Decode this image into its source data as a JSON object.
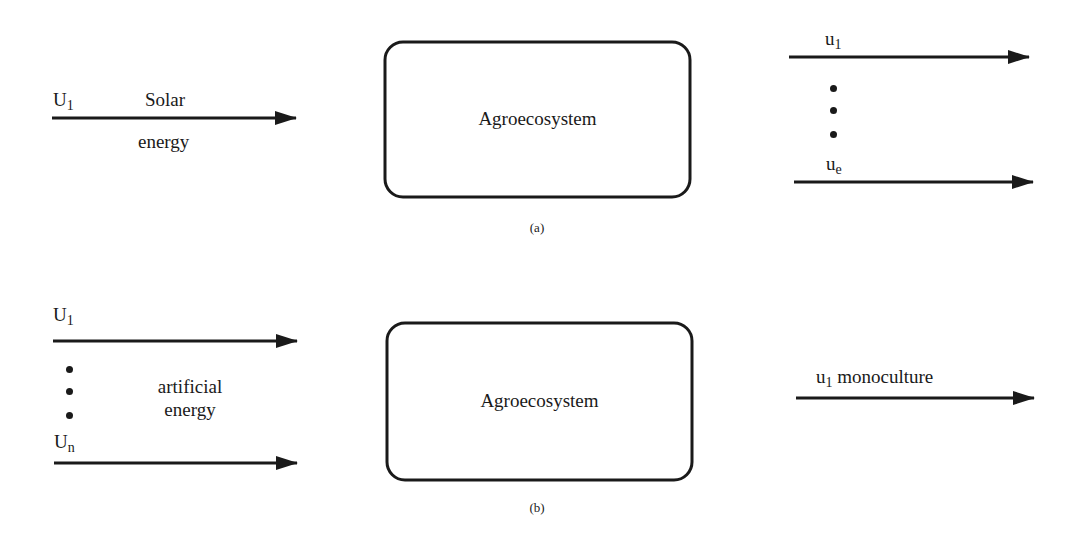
{
  "panel_a": {
    "input": {
      "symbol": "U",
      "subscript": "1",
      "label_top": "Solar",
      "label_bottom": "energy"
    },
    "system_label": "Agroecosystem",
    "outputs": [
      {
        "symbol": "u",
        "subscript": "1"
      },
      {
        "symbol": "u",
        "subscript": "e"
      }
    ],
    "caption": "(a)"
  },
  "panel_b": {
    "inputs": [
      {
        "symbol": "U",
        "subscript": "1"
      },
      {
        "symbol": "U",
        "subscript": "n"
      }
    ],
    "input_label_line1": "artificial",
    "input_label_line2": "energy",
    "system_label": "Agroecosystem",
    "output": {
      "symbol": "u",
      "subscript": "1",
      "label": "monoculture"
    },
    "caption": "(b)"
  },
  "colors": {
    "stroke": "#1a1a1a",
    "background": "#ffffff"
  }
}
